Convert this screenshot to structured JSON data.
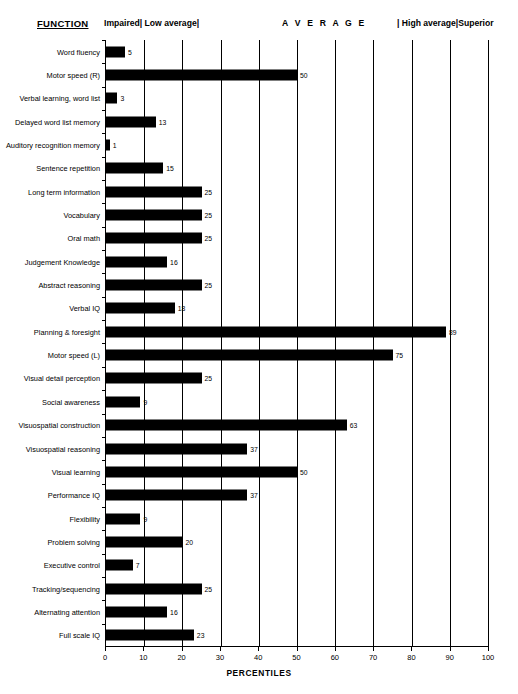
{
  "header": {
    "function_title": "FUNCTION",
    "bands": [
      {
        "name": "impaired-low-average",
        "label": "Impaired| Low average|"
      },
      {
        "name": "average",
        "label": "A V E R A G E"
      },
      {
        "name": "high-average-superior",
        "label": "| High average|Superior"
      }
    ]
  },
  "chart_data": {
    "type": "bar",
    "orientation": "horizontal",
    "title": "",
    "xlabel": "PERCENTILES",
    "ylabel": "FUNCTION",
    "xlim": [
      0,
      100
    ],
    "xticks": [
      0,
      10,
      20,
      30,
      40,
      50,
      60,
      70,
      80,
      90,
      100
    ],
    "grid": true,
    "grid_axis": "x",
    "bar_color": "#000000",
    "categories": [
      "Word fluency",
      "Motor speed (R)",
      "Verbal learning, word list",
      "Delayed word list memory",
      "Auditory recognition memory",
      "Sentence repetition",
      "Long term information",
      "Vocabulary",
      "Oral math",
      "Judgement Knowledge",
      "Abstract reasoning",
      "Verbal IQ",
      "Planning & foresight",
      "Motor speed (L)",
      "Visual detail perception",
      "Social awareness",
      "Visuospatial construction",
      "Visuospatial reasoning",
      "Visual learning",
      "Performance IQ",
      "Flexibility",
      "Problem solving",
      "Executive control",
      "Tracking/sequencing",
      "Alternating attention",
      "Full scale IQ"
    ],
    "values": [
      5,
      50,
      3,
      13,
      1,
      15,
      25,
      25,
      25,
      16,
      25,
      18,
      89,
      75,
      25,
      9,
      63,
      37,
      50,
      37,
      9,
      20,
      7,
      25,
      16,
      23
    ],
    "value_labels": [
      "5",
      "50",
      "3",
      "13",
      "1",
      "15",
      "25",
      "25",
      "25",
      "16",
      "25",
      "18",
      "89",
      "75",
      "25",
      "9",
      "63",
      "37",
      "50",
      "37",
      "9",
      "20",
      "7",
      "25",
      "16",
      "23"
    ]
  }
}
